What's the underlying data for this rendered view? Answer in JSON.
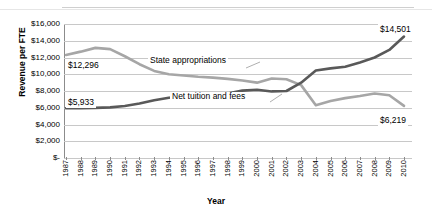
{
  "chart_data": {
    "type": "line",
    "title": "",
    "xlabel": "Year",
    "ylabel": "Revenue per FTE",
    "ylim": [
      0,
      16000
    ],
    "ytick_labels": [
      "$16,000",
      "$14,000",
      "$12,000",
      "$10,000",
      "$8,000",
      "$6,000",
      "$4,000",
      "$2,000",
      "$-"
    ],
    "ytick_values": [
      16000,
      14000,
      12000,
      10000,
      8000,
      6000,
      4000,
      2000,
      0
    ],
    "grid": true,
    "legend": "inline-labels",
    "categories": [
      "1987",
      "1988",
      "1989",
      "1990",
      "1991",
      "1992",
      "1993",
      "1994",
      "1995",
      "1996",
      "1997",
      "1998",
      "1999",
      "2000",
      "2001",
      "2002",
      "2003",
      "2004",
      "2005",
      "2006",
      "2007",
      "2008",
      "2009",
      "2010"
    ],
    "series": [
      {
        "name": "State appropriations",
        "color": "#a6a6a6",
        "values": [
          12296,
          12700,
          13150,
          13000,
          12150,
          11200,
          10400,
          10000,
          9850,
          9700,
          9600,
          9450,
          9250,
          9000,
          9500,
          9400,
          8700,
          6300,
          6800,
          7150,
          7400,
          7700,
          7500,
          6219
        ]
      },
      {
        "name": "Net tuition and fees",
        "color": "#595959",
        "values": [
          5933,
          5950,
          5980,
          6050,
          6200,
          6500,
          6900,
          7200,
          7350,
          7450,
          7550,
          7700,
          8050,
          8150,
          7950,
          8000,
          9000,
          10450,
          10700,
          10900,
          11400,
          12000,
          12900,
          14501
        ]
      }
    ],
    "annotations": [
      {
        "name": "start-label-state",
        "text": "$12,296"
      },
      {
        "name": "start-label-tuition",
        "text": "$5,933"
      },
      {
        "name": "end-label-tuition",
        "text": "$14,501"
      },
      {
        "name": "end-label-state",
        "text": "$6,219"
      },
      {
        "name": "series-label-state",
        "text": "State appropriations"
      },
      {
        "name": "series-label-tuition",
        "text": "Net tuition and fees"
      }
    ]
  }
}
